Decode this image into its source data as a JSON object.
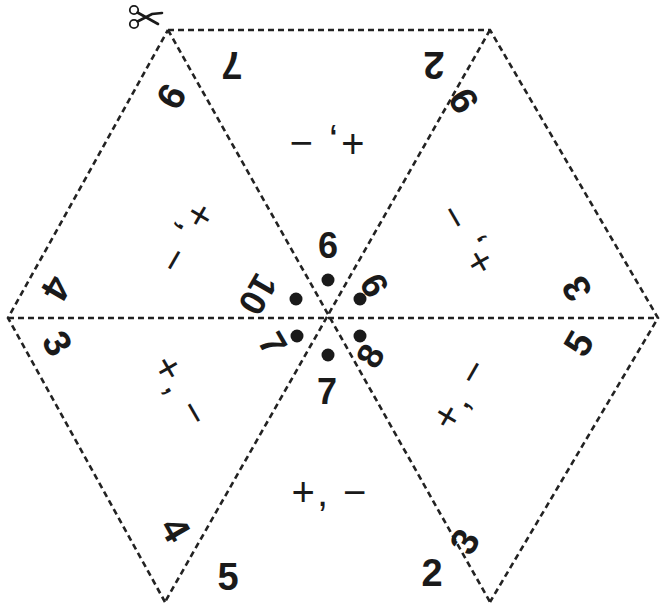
{
  "puzzle": {
    "title": "Hexagon triangle puzzle",
    "cut_marker": "scissors-icon",
    "colors": {
      "ink": "#1a1a1a",
      "line": "#222222",
      "background": "#ffffff"
    },
    "vertices": {
      "center": [
        328,
        318
      ],
      "top_left": [
        168,
        30
      ],
      "top_right": [
        490,
        30
      ],
      "right": [
        658,
        318
      ],
      "bottom_right": [
        490,
        602
      ],
      "bottom_left": [
        165,
        602
      ],
      "left": [
        8,
        318
      ]
    },
    "triangles": [
      {
        "position": "top",
        "operations": "+, −",
        "outer_left": "2",
        "outer_right": "7",
        "inner": "6"
      },
      {
        "position": "top-right",
        "operations": "+, −",
        "outer_left": "9",
        "outer_right": "3",
        "inner": "9"
      },
      {
        "position": "bottom-right",
        "operations": "+, −",
        "outer_left": "5",
        "outer_right": "3",
        "inner": "8"
      },
      {
        "position": "bottom",
        "operations": "+, −",
        "outer_left": "5",
        "outer_right": "2",
        "inner": "7"
      },
      {
        "position": "bottom-left",
        "operations": "+, −",
        "outer_left": "4",
        "outer_right": "3",
        "inner": "7"
      },
      {
        "position": "top-left",
        "operations": "+, −",
        "outer_left": "9",
        "outer_right": "4",
        "inner": "10"
      }
    ]
  }
}
